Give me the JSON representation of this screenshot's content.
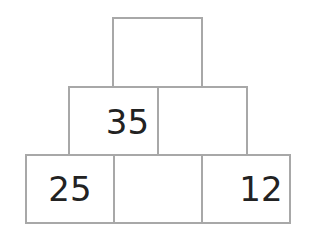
{
  "pyramid": {
    "rows": [
      {
        "cells": [
          {
            "value": ""
          }
        ]
      },
      {
        "cells": [
          {
            "value": "35"
          },
          {
            "value": ""
          }
        ]
      },
      {
        "cells": [
          {
            "value": "25"
          },
          {
            "value": ""
          },
          {
            "value": "12"
          }
        ]
      }
    ],
    "colors": {
      "border": "#a8a8a8",
      "text": "#222222",
      "background": "#ffffff"
    }
  }
}
